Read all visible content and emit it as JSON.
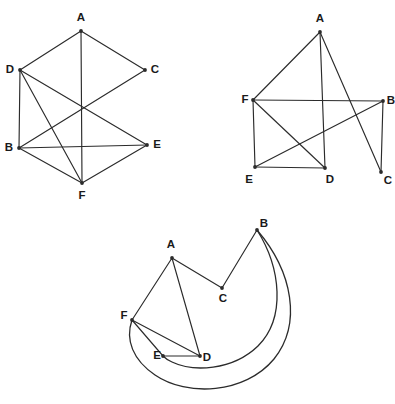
{
  "figure": {
    "background_color": "#ffffff",
    "stroke_color": "#2b2b2b",
    "label_color": "#1a1a1a",
    "width": 395,
    "height": 404
  },
  "graphs": [
    {
      "id": "graph-1",
      "name": "top-left-graph",
      "vertices": [
        {
          "label": "A",
          "x": 81,
          "y": 31,
          "label_x": 81,
          "label_y": 18
        },
        {
          "label": "B",
          "x": 19,
          "y": 148,
          "label_x": 9,
          "label_y": 148
        },
        {
          "label": "C",
          "x": 145,
          "y": 70,
          "label_x": 155,
          "label_y": 70
        },
        {
          "label": "D",
          "x": 20,
          "y": 70,
          "label_x": 10,
          "label_y": 70
        },
        {
          "label": "E",
          "x": 147,
          "y": 145,
          "label_x": 157,
          "label_y": 145
        },
        {
          "label": "F",
          "x": 82,
          "y": 183,
          "label_x": 82,
          "label_y": 196
        }
      ],
      "edges": [
        {
          "from": "A",
          "to": "D"
        },
        {
          "from": "A",
          "to": "C"
        },
        {
          "from": "A",
          "to": "F"
        },
        {
          "from": "D",
          "to": "E"
        },
        {
          "from": "D",
          "to": "F"
        },
        {
          "from": "C",
          "to": "E"
        },
        {
          "from": "B",
          "to": "E"
        },
        {
          "from": "B",
          "to": "F"
        },
        {
          "from": "E",
          "to": "F"
        },
        {
          "from": "D",
          "to": "B"
        }
      ]
    },
    {
      "id": "graph-2",
      "name": "top-right-graph",
      "vertices": [
        {
          "label": "A",
          "x": 320,
          "y": 32,
          "label_x": 320,
          "label_y": 19
        },
        {
          "label": "B",
          "x": 383,
          "y": 101,
          "label_x": 392,
          "label_y": 101
        },
        {
          "label": "C",
          "x": 381,
          "y": 172,
          "label_x": 389,
          "label_y": 181
        },
        {
          "label": "D",
          "x": 325,
          "y": 168,
          "label_x": 329,
          "label_y": 180
        },
        {
          "label": "E",
          "x": 255,
          "y": 167,
          "label_x": 249,
          "label_y": 180
        },
        {
          "label": "F",
          "x": 253,
          "y": 100,
          "label_x": 245,
          "label_y": 100
        }
      ],
      "edges": [
        {
          "from": "A",
          "to": "F"
        },
        {
          "from": "A",
          "to": "D"
        },
        {
          "from": "A",
          "to": "C"
        },
        {
          "from": "F",
          "to": "B"
        },
        {
          "from": "F",
          "to": "E"
        },
        {
          "from": "F",
          "to": "D"
        },
        {
          "from": "E",
          "to": "D"
        },
        {
          "from": "E",
          "to": "B"
        },
        {
          "from": "B",
          "to": "C"
        }
      ]
    },
    {
      "id": "graph-3",
      "name": "bottom-graph",
      "vertices": [
        {
          "label": "A",
          "x": 172,
          "y": 258,
          "label_x": 171,
          "label_y": 245
        },
        {
          "label": "B",
          "x": 257,
          "y": 230,
          "label_x": 263,
          "label_y": 224
        },
        {
          "label": "C",
          "x": 222,
          "y": 288,
          "label_x": 223,
          "label_y": 299
        },
        {
          "label": "D",
          "x": 200,
          "y": 356,
          "label_x": 206,
          "label_y": 358
        },
        {
          "label": "E",
          "x": 163,
          "y": 356,
          "label_x": 159,
          "label_y": 356
        },
        {
          "label": "F",
          "x": 132,
          "y": 320,
          "label_x": 124,
          "label_y": 316
        }
      ],
      "straight_edges": [
        {
          "from": "A",
          "to": "C"
        },
        {
          "from": "A",
          "to": "F"
        },
        {
          "from": "A",
          "to": "D"
        },
        {
          "from": "C",
          "to": "B"
        },
        {
          "from": "F",
          "to": "E"
        },
        {
          "from": "F",
          "to": "D"
        },
        {
          "from": "E",
          "to": "D"
        }
      ],
      "curved_edges": [
        {
          "from": "B",
          "to": "E",
          "note": "inner crescent arc sweeping right and below",
          "path": "M 257 230 C 281 268 286 318 258 346 C 232 371 193 372 172 362 C 167 360 165 358 163 356"
        },
        {
          "from": "B",
          "to": "F",
          "note": "outer crescent arc sweeping far right and below",
          "path": "M 257 230 C 293 272 302 324 274 359 C 245 394 187 397 155 375 C 133 360 125 340 132 320"
        }
      ]
    }
  ]
}
